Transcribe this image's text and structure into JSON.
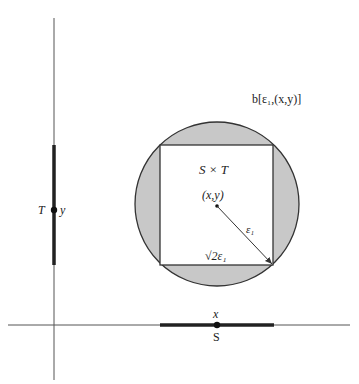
{
  "diagram": {
    "labels": {
      "ball": "b[ε₁,(x,y)]",
      "product": "S × T",
      "center_point": "(x,y)",
      "radius": "ε₁",
      "side_length": "√2ε₁",
      "vertical_set": "T",
      "vertical_point": "y",
      "horizontal_point": "x",
      "horizontal_set": "S"
    },
    "colors": {
      "ball_fill": "#c8c8c8",
      "square_fill": "#ffffff",
      "stroke": "#333333",
      "thick_segment": "#222222",
      "background": "#ffffff"
    },
    "geometry": {
      "circle": {
        "cx": 217,
        "cy": 204,
        "r": 82
      },
      "square": {
        "x": 160,
        "y": 145,
        "w": 113,
        "h": 120
      },
      "vertical_axis_x": 54,
      "horizontal_axis_y": 325,
      "T_interval": [
        145,
        265
      ],
      "S_interval": [
        160,
        274
      ]
    }
  }
}
